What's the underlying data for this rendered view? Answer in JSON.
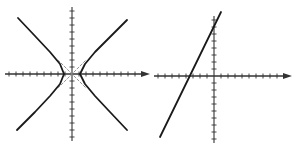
{
  "chart_data": [
    {
      "type": "line",
      "title": "",
      "description": "Hyperbola with dashed asymptotes",
      "xlabel": "",
      "ylabel": "",
      "grid": false,
      "legend": null,
      "axes": {
        "origin_px": [
          72,
          74
        ],
        "tick_spacing_px": 7,
        "x_ticks_each_side": 9,
        "y_ticks_each_side": 9,
        "x_arrow": true
      },
      "series": [
        {
          "name": "hyperbola-right-branch",
          "style": "solid",
          "points": [
            [
              127,
              20
            ],
            [
              110,
              37
            ],
            [
              95,
              52
            ],
            [
              85,
              64
            ],
            [
              80,
              74
            ],
            [
              85,
              84
            ],
            [
              95,
              96
            ],
            [
              110,
              112
            ],
            [
              127,
              130
            ]
          ]
        },
        {
          "name": "hyperbola-left-branch",
          "style": "solid",
          "points": [
            [
              18,
              18
            ],
            [
              35,
              36
            ],
            [
              50,
              52
            ],
            [
              60,
              64
            ],
            [
              64,
              74
            ],
            [
              60,
              84
            ],
            [
              50,
              96
            ],
            [
              35,
              112
            ],
            [
              17,
              130
            ]
          ]
        },
        {
          "name": "asymptote-1",
          "style": "dashed",
          "points": [
            [
              58,
              60
            ],
            [
              86,
              88
            ]
          ]
        },
        {
          "name": "asymptote-2",
          "style": "dashed",
          "points": [
            [
              58,
              88
            ],
            [
              86,
              60
            ]
          ]
        }
      ]
    },
    {
      "type": "line",
      "title": "",
      "description": "Straight line with positive slope",
      "xlabel": "",
      "ylabel": "",
      "grid": false,
      "legend": null,
      "axes": {
        "origin_px": [
          214,
          76
        ],
        "tick_spacing_px": 7,
        "x_ticks_left": 8,
        "x_ticks_right": 9,
        "y_ticks_up": 8,
        "y_ticks_down": 9,
        "x_arrow": true
      },
      "series": [
        {
          "name": "line",
          "style": "solid",
          "points": [
            [
              160,
              137
            ],
            [
              221,
              12
            ]
          ]
        }
      ]
    }
  ],
  "colors": {
    "curve": "#1a1a1a",
    "axis": "#333333",
    "asymptote": "#888888",
    "background": "#ffffff"
  }
}
